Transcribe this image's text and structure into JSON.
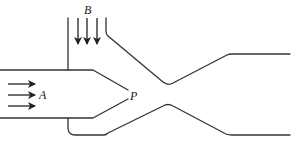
{
  "diagram": {
    "type": "ejector / jet pump schematic",
    "labels": {
      "inlet_primary": "A",
      "inlet_secondary": "B",
      "nozzle_exit_point": "P"
    },
    "colors": {
      "line": "#333333",
      "background": "#ffffff"
    },
    "arrows": {
      "primary_flow_count": 3,
      "primary_flow_direction": "right",
      "secondary_flow_count": 3,
      "secondary_flow_direction": "down"
    }
  }
}
